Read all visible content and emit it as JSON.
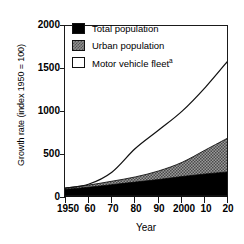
{
  "chart_data": {
    "type": "area",
    "title": "",
    "xlabel": "Year",
    "ylabel": "Growth rate (index 1950 = 100)",
    "xlim": [
      1950,
      2020
    ],
    "ylim": [
      0,
      2000
    ],
    "grid": false,
    "legend_position": "top-left",
    "stacked": true,
    "x": [
      1950,
      1960,
      1970,
      1980,
      1990,
      2000,
      2010,
      2020
    ],
    "xtick_labels": [
      "1950",
      "60",
      "70",
      "80",
      "90",
      "2000",
      "10",
      "20"
    ],
    "ytick_labels": [
      "0",
      "500",
      "1000",
      "1500",
      "2000"
    ],
    "ytick_values": [
      0,
      500,
      1000,
      1500,
      2000
    ],
    "series": [
      {
        "name": "Total population",
        "style": "filled-black",
        "color": "#000000",
        "values": [
          100,
          125,
          155,
          185,
          215,
          250,
          280,
          305
        ]
      },
      {
        "name": "Urban population",
        "style": "filled-gray-hatch",
        "color": "#8f8f8f",
        "note": "plotted stacked above total population",
        "values": [
          15,
          25,
          40,
          60,
          100,
          165,
          280,
          400
        ],
        "cumulative_values": [
          115,
          150,
          195,
          245,
          315,
          415,
          560,
          705
        ]
      },
      {
        "name": "Motor vehicle fleet",
        "style": "line-white-area",
        "color": "#ffffff",
        "footnote_marker": "a",
        "values": [
          115,
          160,
          300,
          575,
          790,
          1010,
          1290,
          1610
        ]
      }
    ]
  },
  "legend": {
    "items": [
      {
        "label": "Total population",
        "swatch": "black",
        "footnote": ""
      },
      {
        "label": "Urban population",
        "swatch": "gray-hatch",
        "footnote": ""
      },
      {
        "label": "Motor vehicle fleet",
        "swatch": "white",
        "footnote": "a"
      }
    ]
  },
  "axes": {
    "y_title": "Growth rate (index 1950 = 100)",
    "x_title": "Year",
    "y_ticks": [
      "2000",
      "1500",
      "1000",
      "500",
      "0"
    ],
    "x_ticks": [
      "1950",
      "60",
      "70",
      "80",
      "90",
      "2000",
      "10",
      "20"
    ]
  },
  "colors": {
    "total_population": "#000000",
    "urban_population": "#8f8f8f",
    "motor_vehicle_fleet": "#ffffff",
    "axis": "#1a1a1a",
    "background": "#ffffff"
  }
}
